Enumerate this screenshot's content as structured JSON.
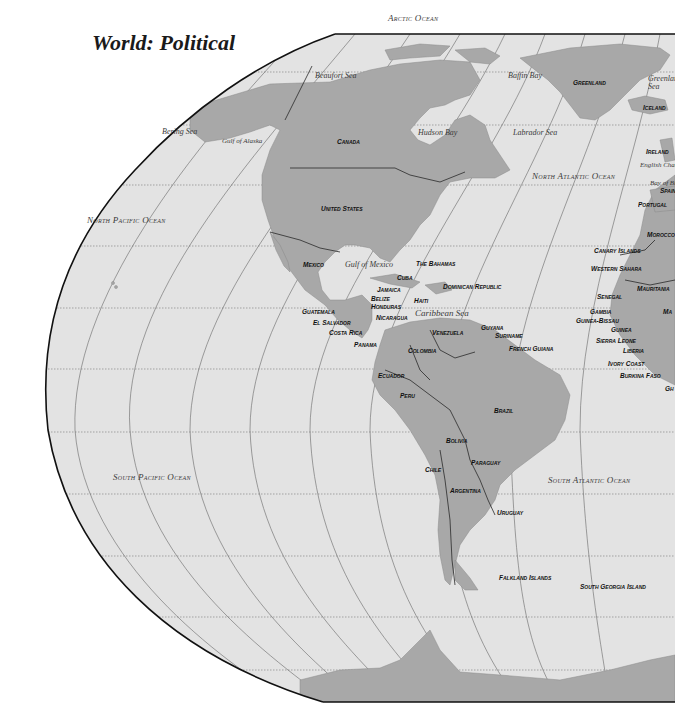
{
  "title": "World: Political",
  "colors": {
    "ocean": "#e3e3e3",
    "land": "#a8a8a8",
    "border": "#2a2a2a",
    "background": "#ffffff",
    "graticule": "#666666"
  },
  "oceans": [
    {
      "name": "Arctic Ocean",
      "x": 388,
      "y": 14
    },
    {
      "name": "North Pacific Ocean",
      "x": 87,
      "y": 216
    },
    {
      "name": "North Atlantic Ocean",
      "x": 532,
      "y": 172
    },
    {
      "name": "South Pacific Ocean",
      "x": 113,
      "y": 473
    },
    {
      "name": "South Atlantic Ocean",
      "x": 548,
      "y": 476
    }
  ],
  "seas": [
    {
      "name": "Beaufort Sea",
      "x": 315,
      "y": 72
    },
    {
      "name": "Baffin Bay",
      "x": 508,
      "y": 72
    },
    {
      "name": "Greenland Sea",
      "x": 648,
      "y": 75
    },
    {
      "name": "Bering Sea",
      "x": 162,
      "y": 128
    },
    {
      "name": "Gulf of Alaska",
      "x": 222,
      "y": 138
    },
    {
      "name": "Hudson Bay",
      "x": 418,
      "y": 129
    },
    {
      "name": "Labrador Sea",
      "x": 513,
      "y": 129
    },
    {
      "name": "English Channel",
      "x": 640,
      "y": 162
    },
    {
      "name": "Bay of Biscay",
      "x": 650,
      "y": 180
    },
    {
      "name": "Gulf of Mexico",
      "x": 345,
      "y": 261
    },
    {
      "name": "Caribbean Sea",
      "x": 415,
      "y": 309
    }
  ],
  "countries": [
    {
      "name": "Greenland",
      "x": 573,
      "y": 80
    },
    {
      "name": "Iceland",
      "x": 643,
      "y": 105
    },
    {
      "name": "Canada",
      "x": 337,
      "y": 139
    },
    {
      "name": "Ireland",
      "x": 646,
      "y": 149
    },
    {
      "name": "Spain",
      "x": 660,
      "y": 188
    },
    {
      "name": "Portugal",
      "x": 638,
      "y": 202
    },
    {
      "name": "United States",
      "x": 321,
      "y": 206
    },
    {
      "name": "Morocco",
      "x": 647,
      "y": 232
    },
    {
      "name": "Canary Islands",
      "x": 594,
      "y": 248
    },
    {
      "name": "Mexico",
      "x": 303,
      "y": 262
    },
    {
      "name": "The Bahamas",
      "x": 416,
      "y": 261
    },
    {
      "name": "Western Sahara",
      "x": 591,
      "y": 266
    },
    {
      "name": "Cuba",
      "x": 397,
      "y": 275
    },
    {
      "name": "Mauritania",
      "x": 637,
      "y": 286
    },
    {
      "name": "Dominican Republic",
      "x": 443,
      "y": 284
    },
    {
      "name": "Jamaica",
      "x": 377,
      "y": 287
    },
    {
      "name": "Senegal",
      "x": 597,
      "y": 294
    },
    {
      "name": "Belize",
      "x": 371,
      "y": 296
    },
    {
      "name": "Haiti",
      "x": 414,
      "y": 298
    },
    {
      "name": "Honduras",
      "x": 371,
      "y": 304
    },
    {
      "name": "Gambia",
      "x": 590,
      "y": 309
    },
    {
      "name": "Ma",
      "x": 663,
      "y": 309
    },
    {
      "name": "Guatemala",
      "x": 302,
      "y": 309
    },
    {
      "name": "Guinea-Bissau",
      "x": 576,
      "y": 318
    },
    {
      "name": "Nicaragua",
      "x": 376,
      "y": 315
    },
    {
      "name": "El Salvador",
      "x": 313,
      "y": 320
    },
    {
      "name": "Guinea",
      "x": 611,
      "y": 327
    },
    {
      "name": "Guyana",
      "x": 481,
      "y": 325
    },
    {
      "name": "Costa Rica",
      "x": 329,
      "y": 330
    },
    {
      "name": "Venezuela",
      "x": 432,
      "y": 330
    },
    {
      "name": "Suriname",
      "x": 495,
      "y": 333
    },
    {
      "name": "Sierra Leone",
      "x": 596,
      "y": 338
    },
    {
      "name": "Panama",
      "x": 354,
      "y": 342
    },
    {
      "name": "French Guiana",
      "x": 509,
      "y": 346
    },
    {
      "name": "Liberia",
      "x": 623,
      "y": 348
    },
    {
      "name": "Colombia",
      "x": 408,
      "y": 348
    },
    {
      "name": "Ivory Coast",
      "x": 608,
      "y": 361
    },
    {
      "name": "Ecuador",
      "x": 378,
      "y": 373
    },
    {
      "name": "Burkina Faso",
      "x": 620,
      "y": 373
    },
    {
      "name": "Gh",
      "x": 665,
      "y": 386
    },
    {
      "name": "Peru",
      "x": 400,
      "y": 393
    },
    {
      "name": "Brazil",
      "x": 494,
      "y": 408
    },
    {
      "name": "Bolivia",
      "x": 446,
      "y": 438
    },
    {
      "name": "Paraguay",
      "x": 471,
      "y": 460
    },
    {
      "name": "Chile",
      "x": 425,
      "y": 467
    },
    {
      "name": "Argentina",
      "x": 450,
      "y": 488
    },
    {
      "name": "Uruguay",
      "x": 497,
      "y": 510
    },
    {
      "name": "Falkland Islands",
      "x": 499,
      "y": 575
    },
    {
      "name": "South Georgia Island",
      "x": 580,
      "y": 584
    }
  ]
}
